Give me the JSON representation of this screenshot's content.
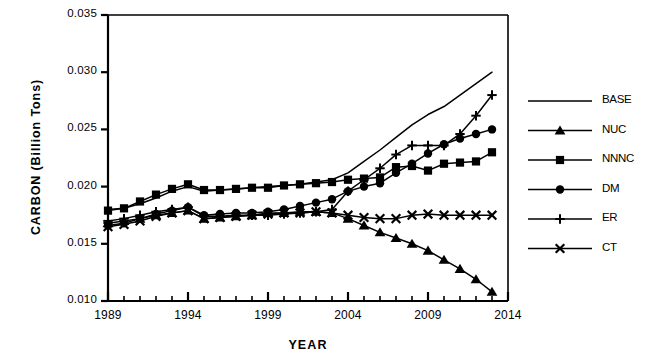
{
  "chart_data": {
    "type": "line",
    "title": "",
    "xlabel": "YEAR",
    "ylabel": "CARBON  (Billion  Tons)",
    "xlim": [
      1989,
      2014
    ],
    "ylim": [
      0.01,
      0.035
    ],
    "xticks": [
      1989,
      1994,
      1999,
      2004,
      2009,
      2014
    ],
    "xtick_labels": [
      "1989",
      "1994",
      "1999",
      "2004",
      "2009",
      "2014"
    ],
    "yticks": [
      0.01,
      0.015,
      0.02,
      0.025,
      0.03,
      0.035
    ],
    "ytick_labels": [
      "0.010",
      "0.015",
      "0.020",
      "0.025",
      "0.030",
      "0.035"
    ],
    "minor_xtick_interval": 1,
    "grid": false,
    "legend_position": "right",
    "line_color": "#000000",
    "x": [
      1989,
      1990,
      1991,
      1992,
      1993,
      1994,
      1995,
      1996,
      1997,
      1998,
      1999,
      2000,
      2001,
      2002,
      2003,
      2004,
      2005,
      2006,
      2007,
      2008,
      2009,
      2010,
      2011,
      2012,
      2013
    ],
    "series": [
      {
        "name": "BASE",
        "marker": "none",
        "values": [
          0.018,
          0.0181,
          0.0185,
          0.019,
          0.0196,
          0.02,
          0.0196,
          0.0197,
          0.0198,
          0.0199,
          0.02,
          0.0201,
          0.0202,
          0.0204,
          0.0206,
          0.0212,
          0.0222,
          0.0232,
          0.0243,
          0.0254,
          0.0263,
          0.027,
          0.028,
          0.029,
          0.03
        ]
      },
      {
        "name": "NUC",
        "marker": "triangle",
        "values": [
          0.0168,
          0.017,
          0.0172,
          0.0175,
          0.0177,
          0.0179,
          0.0172,
          0.0173,
          0.0174,
          0.0175,
          0.0177,
          0.0177,
          0.0178,
          0.0178,
          0.0177,
          0.0172,
          0.0166,
          0.016,
          0.0155,
          0.015,
          0.0144,
          0.0136,
          0.0128,
          0.0119,
          0.0108
        ]
      },
      {
        "name": "NNNC",
        "marker": "square",
        "values": [
          0.0179,
          0.0181,
          0.0187,
          0.0193,
          0.0198,
          0.0202,
          0.0197,
          0.0197,
          0.0198,
          0.0199,
          0.0199,
          0.0201,
          0.0202,
          0.0203,
          0.0204,
          0.0206,
          0.0207,
          0.0208,
          0.0217,
          0.0218,
          0.0214,
          0.022,
          0.0221,
          0.0222,
          0.023
        ]
      },
      {
        "name": "DM",
        "marker": "circle",
        "values": [
          0.0166,
          0.0168,
          0.0172,
          0.0176,
          0.0179,
          0.0182,
          0.0175,
          0.0176,
          0.0177,
          0.0177,
          0.0178,
          0.018,
          0.0183,
          0.0186,
          0.0189,
          0.0196,
          0.02,
          0.0203,
          0.0212,
          0.022,
          0.0229,
          0.0237,
          0.0242,
          0.0246,
          0.025
        ]
      },
      {
        "name": "ER",
        "marker": "plus",
        "values": [
          0.017,
          0.0172,
          0.0175,
          0.0178,
          0.018,
          0.0182,
          0.0174,
          0.0174,
          0.0175,
          0.0175,
          0.0175,
          0.0176,
          0.0177,
          0.0178,
          0.018,
          0.0196,
          0.0206,
          0.0216,
          0.0228,
          0.0236,
          0.0236,
          0.0236,
          0.0246,
          0.0262,
          0.028
        ]
      },
      {
        "name": "CT",
        "marker": "x",
        "values": [
          0.0165,
          0.0167,
          0.017,
          0.0174,
          0.0177,
          0.0179,
          0.0172,
          0.0173,
          0.0174,
          0.0175,
          0.0176,
          0.0177,
          0.0177,
          0.0178,
          0.0177,
          0.0175,
          0.0173,
          0.0172,
          0.0172,
          0.0175,
          0.0176,
          0.0175,
          0.0175,
          0.0175,
          0.0175
        ]
      }
    ]
  },
  "legend": {
    "items": [
      {
        "label": "BASE",
        "marker": "none"
      },
      {
        "label": "NUC",
        "marker": "triangle"
      },
      {
        "label": "NNNC",
        "marker": "square"
      },
      {
        "label": "DM",
        "marker": "circle"
      },
      {
        "label": "ER",
        "marker": "plus"
      },
      {
        "label": "CT",
        "marker": "x"
      }
    ]
  }
}
